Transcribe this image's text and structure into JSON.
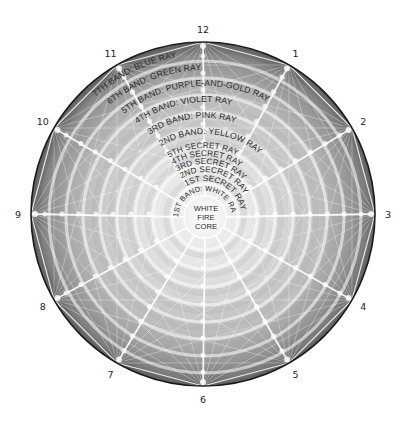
{
  "diagram": {
    "center": {
      "x": 203,
      "y": 214
    },
    "outer_radius": 172,
    "core_radius": 21,
    "colors": {
      "outer_fill": "#6e6e6e",
      "inner_fill": "#f2f2f2",
      "ring_line": "#ffffff",
      "spoke_line": "#ffffff",
      "border": "#1a1a1a",
      "text": "#2a2a2a"
    },
    "clock_positions": [
      {
        "label": "12",
        "angle": 0
      },
      {
        "label": "1",
        "angle": 30
      },
      {
        "label": "2",
        "angle": 60
      },
      {
        "label": "3",
        "angle": 90
      },
      {
        "label": "4",
        "angle": 120
      },
      {
        "label": "5",
        "angle": 150
      },
      {
        "label": "6",
        "angle": 180
      },
      {
        "label": "7",
        "angle": 210
      },
      {
        "label": "8",
        "angle": 240
      },
      {
        "label": "9",
        "angle": 270
      },
      {
        "label": "10",
        "angle": 300
      },
      {
        "label": "11",
        "angle": 330
      }
    ],
    "bands": [
      {
        "label": "7TH BAND:  BLUE RAY",
        "radius": 163
      },
      {
        "label": "6TH BAND:  GREEN RAY",
        "radius": 148
      },
      {
        "label": "5TH BAND:  PURPLE-AND-GOLD RAY",
        "radius": 132
      },
      {
        "label": "4TH BAND:  VIOLET RAY",
        "radius": 116
      },
      {
        "label": "3RD BAND:  PINK RAY",
        "radius": 100
      },
      {
        "label": "2ND BAND:  YELLOW RAY",
        "radius": 84
      },
      {
        "label": "5TH SECRET RAY",
        "radius": 70
      },
      {
        "label": "4TH SECRET RAY",
        "radius": 62
      },
      {
        "label": "3RD SECRET RAY",
        "radius": 54
      },
      {
        "label": "2ND SECRET RAY",
        "radius": 46
      },
      {
        "label": "1ST SECRET RAY",
        "radius": 37
      },
      {
        "label": "1ST BAND: WHITE RAY",
        "radius": 27
      }
    ],
    "core": {
      "lines": [
        "WHITE",
        "FIRE",
        "CORE"
      ]
    },
    "ring_radii": [
      33,
      52,
      70,
      88,
      105,
      122,
      139,
      156
    ]
  }
}
